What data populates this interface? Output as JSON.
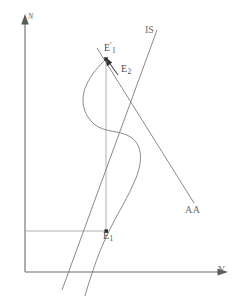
{
  "figure": {
    "background_color": "#ffffff",
    "line_color": "#7a7a7a",
    "axis_color": "#6b6b6b",
    "label_color": "#4d4d4d",
    "point_color": "#333333",
    "axes": {
      "y_label": "N",
      "x_label": "Y",
      "y_arrow": "up",
      "x_arrow": "right"
    },
    "curves": [
      {
        "name": "IS",
        "label": "IS",
        "type": "line",
        "description": "upward sloping straight line"
      },
      {
        "name": "AA",
        "label": "AA",
        "type": "line",
        "description": "downward sloping straight line"
      },
      {
        "name": "S-curve",
        "label": "",
        "type": "s-curve",
        "description": "backward bending S shaped labour market curve"
      }
    ],
    "points": [
      {
        "id": "E1prime",
        "base": "E",
        "sup": "'",
        "sub": "1"
      },
      {
        "id": "E2",
        "base": "E",
        "sup": "",
        "sub": "2"
      },
      {
        "id": "E1",
        "base": "E",
        "sup": "",
        "sub": "1"
      }
    ],
    "labels": {
      "e1_prime_base": "E",
      "e1_prime_sup": "'",
      "e1_prime_sub": "1",
      "e2_base": "E",
      "e2_sub": "2",
      "e1_base": "E",
      "e1_sub": "1",
      "is": "IS",
      "aa": "AA",
      "axis_y": "N",
      "axis_x": "Y"
    },
    "guides": [
      {
        "name": "vertical-guide",
        "description": "vertical dotted line from E1 up to E1 prime"
      },
      {
        "name": "horizontal-guide",
        "description": "horizontal dotted line from y-axis to E1"
      }
    ],
    "annotations": [
      {
        "name": "adjustment-arrow",
        "description": "arrow from E2 pointing up-left to E1 prime"
      }
    ]
  }
}
